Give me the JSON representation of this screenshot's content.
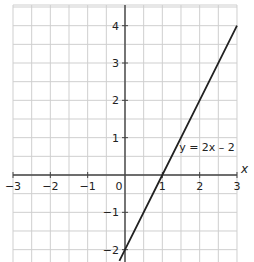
{
  "chart_data": {
    "type": "line",
    "title": "",
    "xlabel": "x",
    "ylabel": "y",
    "xlim": [
      -3,
      3
    ],
    "ylim": [
      -2.3,
      4.5
    ],
    "grid": true,
    "grid_step": 0.5,
    "x_ticks": [
      -3,
      -2,
      -1,
      0,
      1,
      2,
      3
    ],
    "x_tick_labels": [
      "-3",
      "-2",
      "-1",
      "0",
      "1",
      "2",
      "3"
    ],
    "y_ticks": [
      -2,
      -1,
      1,
      2,
      3,
      4
    ],
    "y_tick_labels": [
      "-2",
      "-1",
      "1",
      "2",
      "3",
      "4"
    ],
    "series": [
      {
        "name": "y = 2x - 2",
        "equation": "y = 2x – 2",
        "x": [
          -0.15,
          0,
          1,
          2,
          3
        ],
        "y": [
          -2.3,
          -2,
          0,
          2,
          4
        ],
        "color": "#222222"
      }
    ],
    "annotations": [
      {
        "text": "y = 2x – 2",
        "x": 1.45,
        "y": 0.65
      }
    ],
    "legend": "none"
  },
  "labels": {
    "x_axis": "x",
    "equation": "y = 2x – 2",
    "origin": "0"
  }
}
